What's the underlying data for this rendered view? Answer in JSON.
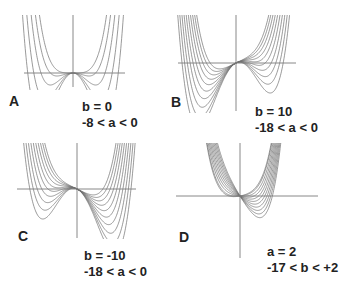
{
  "figure": {
    "curve_color": "#6e6e6e",
    "axis_color": "#7a7a7a",
    "text_color": "#222222"
  },
  "panels": [
    {
      "letter": "A",
      "param_line1": "b = 0",
      "param_line2": "-8 < a < 0",
      "b": 0,
      "a_values": [
        -8,
        -6,
        -4,
        -2,
        0
      ]
    },
    {
      "letter": "B",
      "param_line1": "b = 10",
      "param_line2": "-18 < a < 0",
      "b": 10,
      "a_values": [
        -18,
        -16,
        -14,
        -12,
        -10,
        -8,
        -6,
        -4,
        -2,
        0
      ]
    },
    {
      "letter": "C",
      "param_line1": "b = -10",
      "param_line2": "-18 < a < 0",
      "b": -10,
      "a_values": [
        -18,
        -16,
        -14,
        -12,
        -10,
        -8,
        -6,
        -4,
        -2,
        0
      ]
    },
    {
      "letter": "D",
      "param_line1": "a = 2",
      "param_line2": "-17 < b < +2",
      "a": 2,
      "b_values": [
        -17,
        -15,
        -13,
        -11,
        -9,
        -7,
        -5,
        -3,
        -1,
        1,
        2
      ]
    }
  ]
}
